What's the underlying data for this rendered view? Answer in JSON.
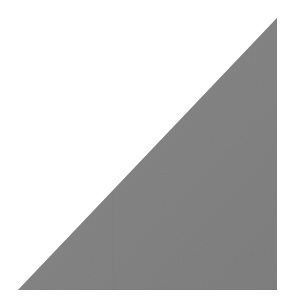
{
  "canvas": {
    "width": 290,
    "height": 308,
    "background_color": "#ffffff",
    "alt_text": "Gray right triangle"
  },
  "shape": {
    "name": "right-triangle",
    "type": "polygon",
    "fill_color": "#808080",
    "fill_color_light": "#8a8a8a",
    "fill_color_dark": "#777777",
    "stroke": "none",
    "texture": "subtle noise grain",
    "points": "18,290 277,290 277,18",
    "vertices": [
      {
        "label": "bottom-left",
        "x": 18,
        "y": 290
      },
      {
        "label": "bottom-right",
        "x": 277,
        "y": 290
      },
      {
        "label": "top-right",
        "x": 277,
        "y": 18
      }
    ],
    "right_angle_vertex": "bottom-right",
    "base_px": 259,
    "height_px": 272,
    "hypotenuse_from": "bottom-left",
    "hypotenuse_to": "top-right"
  },
  "seam": {
    "name": "vertical-seam-line",
    "visible": true,
    "x": 113,
    "y_top": 192,
    "y_bottom": 290,
    "color": "#7a7a7a",
    "opacity": 0.35
  }
}
